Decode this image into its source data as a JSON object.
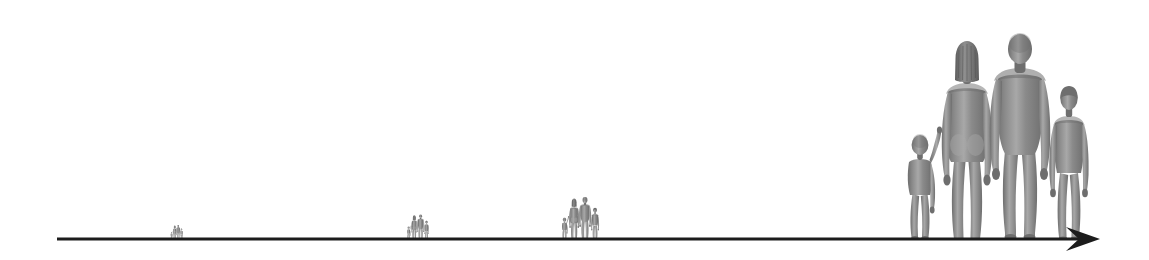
{
  "canvas": {
    "width": 1149,
    "height": 260,
    "background_color": "#ffffff"
  },
  "diagram": {
    "type": "scale-progression",
    "figure_fill_color": "#8a8a8a",
    "figure_shade_color": "#6e6e6e",
    "figure_highlight_color": "#a8a8a8"
  },
  "axis": {
    "name": "baseline-arrow",
    "color": "#1c1c1c",
    "start_x": 57,
    "end_x": 1100,
    "y": 239,
    "thickness": 3,
    "arrowhead": "right",
    "arrowhead_length": 34,
    "arrowhead_half_width": 12
  },
  "groups": [
    {
      "id": "group-1",
      "label": "family-group-smallest",
      "left": 170,
      "baseline_y": 239,
      "scale": 0.068,
      "height_px": 14,
      "width_px": 16,
      "figure_count": 4
    },
    {
      "id": "group-2",
      "label": "family-group-small",
      "left": 406,
      "baseline_y": 239,
      "scale": 0.12,
      "height_px": 25,
      "width_px": 29,
      "figure_count": 4
    },
    {
      "id": "group-3",
      "label": "family-group-medium",
      "left": 560,
      "baseline_y": 239,
      "scale": 0.205,
      "height_px": 42,
      "width_px": 53,
      "figure_count": 4
    },
    {
      "id": "group-4",
      "label": "family-group-largest",
      "left": 898,
      "baseline_y": 239,
      "scale": 1.0,
      "height_px": 206,
      "width_px": 195,
      "figure_count": 4
    }
  ],
  "figures": [
    {
      "id": "toddler",
      "name": "toddler-figure",
      "order": 1,
      "relative_height": 0.5,
      "pose": "standing, left arm raised holding woman's hand"
    },
    {
      "id": "woman",
      "name": "woman-figure",
      "order": 2,
      "relative_height": 0.955,
      "pose": "standing, shoulder-length bob hair, holding toddler's hand"
    },
    {
      "id": "man",
      "name": "man-figure",
      "order": 3,
      "relative_height": 1.0,
      "pose": "standing, broad shoulders, arms at sides"
    },
    {
      "id": "child",
      "name": "child-figure",
      "order": 4,
      "relative_height": 0.74,
      "pose": "standing, short hair, arms at sides"
    }
  ]
}
